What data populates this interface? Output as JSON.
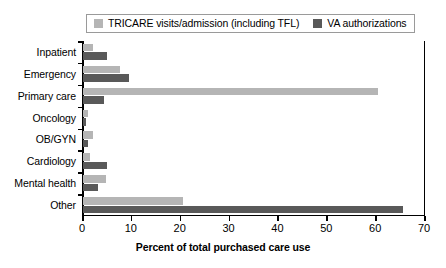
{
  "legend": {
    "position": "top",
    "entries": [
      {
        "label": "TRICARE visits/admission (including TFL)",
        "color": "#b5b5b5",
        "name": "legend-tricare"
      },
      {
        "label": "VA authorizations",
        "color": "#595959",
        "name": "legend-va"
      }
    ]
  },
  "axis": {
    "x_title": "Percent of total purchased care use",
    "x_ticks": [
      "0",
      "10",
      "20",
      "30",
      "40",
      "50",
      "60",
      "70"
    ]
  },
  "chart_data": {
    "type": "bar",
    "orientation": "horizontal",
    "title": "",
    "subtitle": "",
    "xlabel": "Percent of total purchased care use",
    "ylabel": "",
    "xlim": [
      0,
      70
    ],
    "xticks": [
      0,
      10,
      20,
      30,
      40,
      50,
      60,
      70
    ],
    "grid": false,
    "legend_position": "top",
    "categories": [
      "Inpatient",
      "Emergency",
      "Primary care",
      "Oncology",
      "OB/GYN",
      "Cardiology",
      "Mental health",
      "Other"
    ],
    "series": [
      {
        "name": "TRICARE visits/admission (including TFL)",
        "color": "#b5b5b5",
        "values": [
          2.0,
          7.5,
          60.4,
          1.0,
          2.0,
          1.5,
          4.7,
          20.5
        ]
      },
      {
        "name": "VA authorizations",
        "color": "#595959",
        "values": [
          5.0,
          9.5,
          4.2,
          0.6,
          1.0,
          5.0,
          3.0,
          65.5
        ]
      }
    ]
  }
}
